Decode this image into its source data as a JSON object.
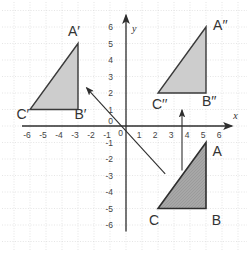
{
  "figure": {
    "width": 249,
    "height": 253,
    "background": "#ffffff",
    "origin_px": [
      126,
      126
    ],
    "unit_px": [
      16,
      16.5
    ],
    "grid": {
      "min": -7,
      "max": 7,
      "color": "#d4d4d4"
    },
    "axes": {
      "color": "#2e2e2e",
      "x_label": "x",
      "y_label": "y",
      "tick_color": "#444444",
      "x_ticks": [
        "-6",
        "-5",
        "-4",
        "-3",
        "-2",
        "-1",
        "0",
        "1",
        "2",
        "3",
        "4",
        "5",
        "6"
      ],
      "y_ticks": [
        "6",
        "5",
        "4",
        "3",
        "2",
        "1",
        "0",
        "-1",
        "-2",
        "-3",
        "-4",
        "-5",
        "-6"
      ]
    },
    "triangles": [
      {
        "name": "triangle-a-prime",
        "fill": "#cdcdcd",
        "stroke": "#3a3a3a",
        "stroke_width": 1.4,
        "hatch": false,
        "vertices": [
          {
            "label": "A′",
            "at": [
              -3,
              5
            ],
            "label_at": [
              -3.25,
              5.45
            ]
          },
          {
            "label": "B′",
            "at": [
              -3,
              1
            ],
            "label_at": [
              -2.85,
              0.42
            ]
          },
          {
            "label": "C′",
            "at": [
              -6,
              1
            ],
            "label_at": [
              -6.45,
              0.42
            ]
          }
        ]
      },
      {
        "name": "triangle-a-double-prime",
        "fill": "#cdcdcd",
        "stroke": "#3a3a3a",
        "stroke_width": 1.4,
        "hatch": false,
        "vertices": [
          {
            "label": "A′′",
            "at": [
              5,
              6
            ],
            "label_at": [
              5.9,
              5.8
            ]
          },
          {
            "label": "B′′",
            "at": [
              5,
              2
            ],
            "label_at": [
              5.2,
              1.2
            ]
          },
          {
            "label": "C′′",
            "at": [
              2,
              2
            ],
            "label_at": [
              2.1,
              1.05
            ]
          }
        ]
      },
      {
        "name": "triangle-a",
        "fill": "#a7a7a7",
        "stroke": "#2e2e2e",
        "stroke_width": 1.6,
        "hatch": true,
        "vertices": [
          {
            "label": "A",
            "at": [
              5,
              -1
            ],
            "label_at": [
              5.7,
              -1.8
            ]
          },
          {
            "label": "B",
            "at": [
              5,
              -5
            ],
            "label_at": [
              5.65,
              -6.0
            ]
          },
          {
            "label": "C",
            "at": [
              2,
              -5
            ],
            "label_at": [
              1.75,
              -6.0
            ]
          }
        ]
      }
    ],
    "arrows": [
      {
        "name": "reflection-arrow",
        "from": [
          2.45,
          -2.9
        ],
        "to": [
          -2.45,
          2.3
        ],
        "color": "#2e2e2e"
      },
      {
        "name": "translation-arrow",
        "from": [
          3.5,
          -2.7
        ],
        "to": [
          3.5,
          0.95
        ],
        "color": "#2e2e2e"
      }
    ]
  }
}
